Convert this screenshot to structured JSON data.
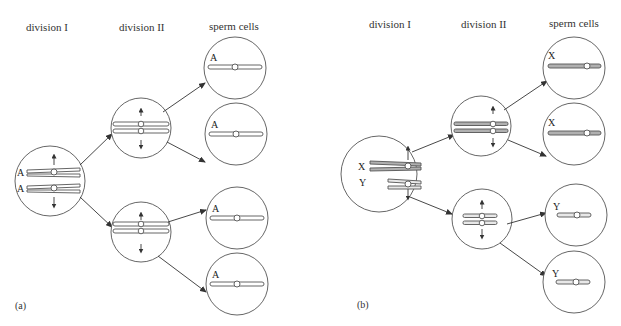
{
  "panels": [
    {
      "id": "a",
      "label": "(a)",
      "headers": {
        "division1": "division I",
        "division2": "division II",
        "sperm": "sperm cells"
      },
      "division1_alleles": [
        "A",
        "A"
      ],
      "sperm_cells": [
        "A",
        "A",
        "A",
        "A"
      ]
    },
    {
      "id": "b",
      "label": "(b)",
      "headers": {
        "division1": "division I",
        "division2": "division II",
        "sperm": "sperm cells"
      },
      "division1_alleles": [
        "X",
        "Y"
      ],
      "sperm_cells": [
        "X",
        "X",
        "Y",
        "Y"
      ]
    }
  ],
  "colors": {
    "line": "#555555",
    "chromosome_shaded": "#b0b0b0",
    "background": "#ffffff"
  }
}
